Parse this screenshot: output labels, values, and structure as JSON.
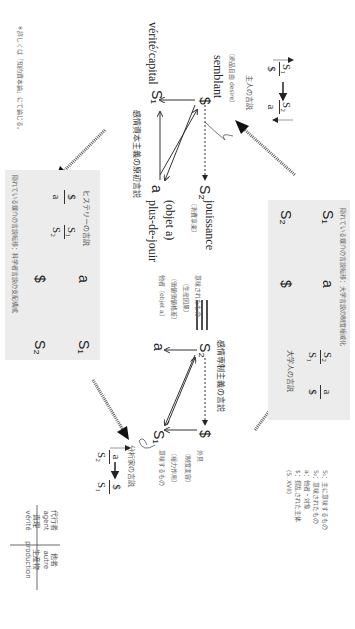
{
  "footnote": "＊詳しくは「知的資本論」にて論じる。",
  "master": {
    "title": "主人の言説",
    "top_left": "S₁",
    "bottom_left": "$",
    "top_right": "S₂",
    "bottom_right": "a"
  },
  "capitalist": {
    "title": "感情資本主義の原初言説",
    "semblant": "semblant",
    "semblant_note": "（商品自由 desire）",
    "verite": "vérité/capital",
    "jouissance": "jouissance",
    "jouissance_note": "（消費享楽）",
    "objet": "(objet a)",
    "plus_de_jouir": "plus-de-jouir",
    "S_barred": "$",
    "S1": "S₁",
    "S2": "S₂",
    "a": "a"
  },
  "hysteric": {
    "caption": "隠れている媒介の言説転移：科学者言説の支配構成",
    "title": "ヒステリーの言説",
    "formula": {
      "top_left": "$",
      "bottom_left": "a",
      "top_right": "S₁",
      "bottom_right": "S₂"
    },
    "schema": {
      "tl": "a",
      "tr": "S₁",
      "bl": "$",
      "br": "S₂"
    }
  },
  "university": {
    "caption": "隠れている媒介の言説転移：大学言説の制度権威化",
    "title": "大学人の言説",
    "formula": {
      "top_left": "S₂",
      "bottom_left": "S₁",
      "top_right": "a",
      "bottom_right": "$"
    },
    "schema": {
      "tl": "S₁",
      "tr": "a",
      "bl": "S₂",
      "br": "$"
    }
  },
  "equivalence": "≡",
  "despotic": {
    "title": "感情専制主義の言説",
    "S2": "S₂",
    "S_barred": "$",
    "a": "a",
    "S1": "S₁",
    "signified_label": "意味されたもの",
    "signified_note": "（生産因果）",
    "other_note": "（価値価値格差）",
    "other_label": "他者（objet a）",
    "appearance_label": "外見",
    "appearance_note": "（制度変容）",
    "power_note": "（権力作用）",
    "signifier_label": "意味するもの"
  },
  "analyst": {
    "title": "分析家の言説",
    "top_left": "a",
    "bottom_left": "S₂",
    "top_right": "$",
    "bottom_right": "S₁"
  },
  "notes": [
    "S₁：主に意味するもの",
    "S₂：意味されたもの",
    "a：他者・対象",
    "$：撹乱された主体",
    "(S. XVII)"
  ],
  "legend_table": {
    "agent_jp": "代行者",
    "agent_fr": "agent",
    "autre_jp": "他者",
    "autre_fr": "autre",
    "verite_jp": "真理",
    "verite_fr": "vérité",
    "production_jp": "生産物",
    "production_fr": "production"
  }
}
